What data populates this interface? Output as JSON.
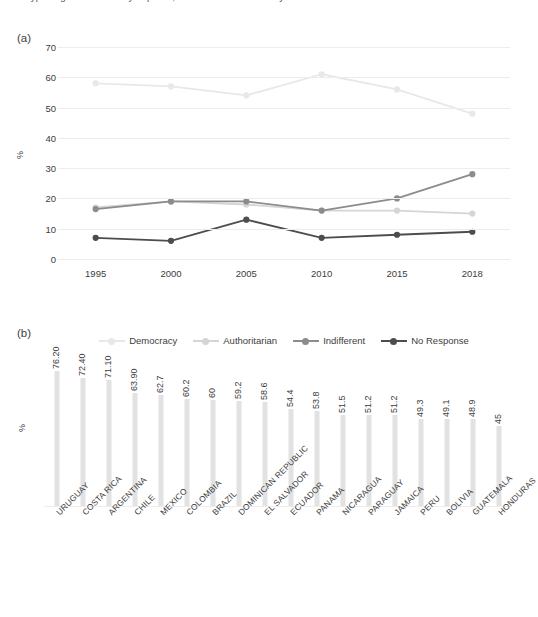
{
  "top_cut_text": "type of government do you prefer, or does it not matter to you?",
  "panels": {
    "a": {
      "label": "(a)"
    },
    "b": {
      "label": "(b)"
    }
  },
  "chart_data": [
    {
      "type": "line",
      "panel": "(a)",
      "title": "",
      "xlabel": "",
      "ylabel": "%",
      "x": [
        "1995",
        "2000",
        "2005",
        "2010",
        "2015",
        "2018"
      ],
      "ylim": [
        0,
        70
      ],
      "yticks": [
        0,
        10,
        20,
        30,
        40,
        50,
        60,
        70
      ],
      "grid": true,
      "legend_position": "bottom",
      "series": [
        {
          "name": "Democracy",
          "color": "#e8e8e8",
          "values": [
            58,
            57,
            54,
            61,
            56,
            48
          ]
        },
        {
          "name": "Authoritarian",
          "color": "#d5d5d5",
          "values": [
            17,
            19,
            18,
            16,
            16,
            15
          ]
        },
        {
          "name": "Indifferent",
          "color": "#8c8c8c",
          "values": [
            16.5,
            19,
            19,
            16,
            20,
            28
          ]
        },
        {
          "name": "No Response",
          "color": "#4d4d4d",
          "values": [
            7,
            6,
            13,
            7,
            8,
            9
          ]
        }
      ]
    },
    {
      "type": "bar",
      "panel": "(b)",
      "title": "",
      "xlabel": "",
      "ylabel": "%",
      "bar_color": "#e2e2e2",
      "ylim": [
        0,
        80
      ],
      "grid": false,
      "categories": [
        "URUGUAY",
        "COSTA RICA",
        "ARGENTINA",
        "CHILE",
        "MEXICO",
        "COLOMBIA",
        "BRAZIL",
        "DOMINICAN REPUBLIC",
        "EL SALVADOR",
        "ECUADOR",
        "PANAMA",
        "NICARAGUA",
        "PARAGUAY",
        "JAMAICA",
        "PERU",
        "BOLIVIA",
        "GUATEMALA",
        "HONDURAS"
      ],
      "values": [
        76.2,
        72.4,
        71.1,
        63.9,
        62.7,
        60.2,
        60,
        59.2,
        58.6,
        54.4,
        53.8,
        51.5,
        51.2,
        51.2,
        49.3,
        49.1,
        48.9,
        45
      ],
      "value_labels": [
        "76.20",
        "72.40",
        "71.10",
        "63.90",
        "62.7",
        "60.2",
        "60",
        "59.2",
        "58.6",
        "54.4",
        "53.8",
        "51.5",
        "51.2",
        "51.2",
        "49.3",
        "49.1",
        "48.9",
        "45"
      ]
    }
  ]
}
